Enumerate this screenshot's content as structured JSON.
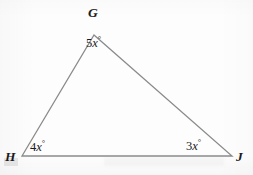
{
  "figure": {
    "type": "triangle",
    "name": "triangle-GHJ",
    "stroke_color": "#8a8a8a",
    "stroke_width": 1.3,
    "background_color": "#fdfdfd",
    "text_color": "#1b1b1b",
    "vertices": [
      {
        "id": "G",
        "label": "G",
        "x": 94,
        "y": 35,
        "label_x": 88,
        "label_y": 6
      },
      {
        "id": "H",
        "label": "H",
        "x": 22,
        "y": 156,
        "label_x": 5,
        "label_y": 150
      },
      {
        "id": "J",
        "label": "J",
        "x": 232,
        "y": 156,
        "label_x": 236,
        "label_y": 150
      }
    ],
    "edges": [
      {
        "from": "H",
        "to": "G"
      },
      {
        "from": "G",
        "to": "J"
      },
      {
        "from": "H",
        "to": "J"
      }
    ],
    "angles": [
      {
        "at": "G",
        "coefficient": "5",
        "variable": "x",
        "unit": "°",
        "text": "5x°"
      },
      {
        "at": "H",
        "coefficient": "4",
        "variable": "x",
        "unit": "°",
        "text": "4x°"
      },
      {
        "at": "J",
        "coefficient": "3",
        "variable": "x",
        "unit": "°",
        "text": "3x°"
      }
    ]
  },
  "labels": {
    "vertex_G": "G",
    "vertex_H": "H",
    "vertex_J": "J",
    "angle_G_num": "5",
    "angle_G_var": "x",
    "angle_G_deg": "°",
    "angle_H_num": "4",
    "angle_H_var": "x",
    "angle_H_deg": "°",
    "angle_J_num": "3",
    "angle_J_var": "x",
    "angle_J_deg": "°"
  }
}
